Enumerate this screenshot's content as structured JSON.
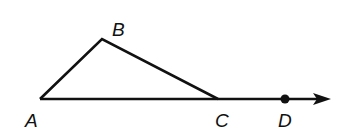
{
  "diagram": {
    "type": "geometry-triangle-exterior-angle",
    "points": {
      "A": {
        "label": "A",
        "x": 40,
        "y": 99
      },
      "B": {
        "label": "B",
        "x": 102,
        "y": 39
      },
      "C": {
        "label": "C",
        "x": 218,
        "y": 99
      },
      "D": {
        "label": "D",
        "x": 285,
        "y": 99
      }
    },
    "ray": {
      "from": "A",
      "through": "D",
      "arrow_tip_x": 331
    },
    "colors": {
      "stroke": "#111111",
      "background": "#ffffff"
    }
  }
}
